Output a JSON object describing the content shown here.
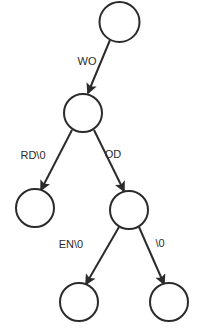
{
  "diagram": {
    "type": "tree",
    "background_color": "#ffffff",
    "stroke_color": "#2b2b2b",
    "node_fill_color": "#ffffff",
    "nodes": [
      {
        "id": "root",
        "label": "",
        "cx": 119.5,
        "cy": 22,
        "r": 20
      },
      {
        "id": "node-wo",
        "label": "",
        "cx": 83,
        "cy": 113,
        "r": 19
      },
      {
        "id": "leaf-word",
        "label": "",
        "cx": 35,
        "cy": 208,
        "r": 19
      },
      {
        "id": "node-wood",
        "label": "",
        "cx": 129,
        "cy": 210,
        "r": 19
      },
      {
        "id": "leaf-wooden",
        "label": "",
        "cx": 79,
        "cy": 302,
        "r": 19
      },
      {
        "id": "leaf-wood",
        "label": "",
        "cx": 169,
        "cy": 302,
        "r": 19
      }
    ],
    "edges": [
      {
        "id": "edge-root-wo",
        "from": "root",
        "to": "node-wo",
        "label": "WO",
        "label_x": 87,
        "label_y": 62,
        "x1": 110,
        "y1": 40,
        "x2": 88,
        "y2": 93
      },
      {
        "id": "edge-wo-word",
        "from": "node-wo",
        "to": "leaf-word",
        "label": "RD\\0",
        "label_x": 33,
        "label_y": 156,
        "x1": 72,
        "y1": 130,
        "x2": 41,
        "y2": 190
      },
      {
        "id": "edge-wo-wood",
        "from": "node-wo",
        "to": "node-wood",
        "label": "OD",
        "label_x": 113,
        "label_y": 155,
        "x1": 94,
        "y1": 130,
        "x2": 124,
        "y2": 191
      },
      {
        "id": "edge-wood-wooden",
        "from": "node-wood",
        "to": "leaf-wooden",
        "label": "EN\\0",
        "label_x": 71,
        "label_y": 245,
        "x1": 119,
        "y1": 227,
        "x2": 86,
        "y2": 284
      },
      {
        "id": "edge-wood-end",
        "from": "node-wood",
        "to": "leaf-wood",
        "label": "\\0",
        "label_x": 160,
        "label_y": 244,
        "x1": 139,
        "y1": 227,
        "x2": 164,
        "y2": 284
      }
    ]
  }
}
